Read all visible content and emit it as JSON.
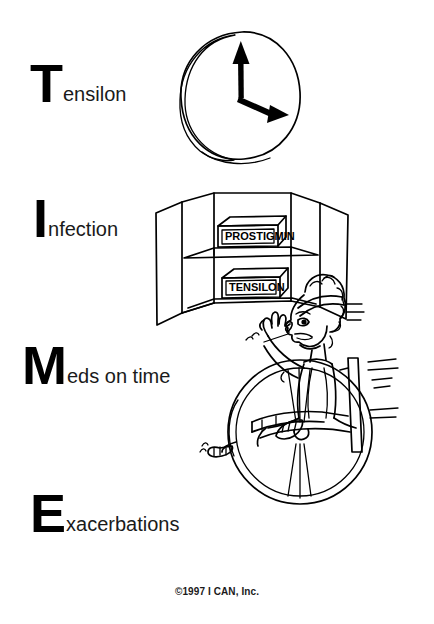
{
  "poster": {
    "title_acronym": "TIME",
    "copyright": "©1997 I CAN, Inc."
  },
  "mnemonic_lines": [
    {
      "id": "tensilon",
      "initial": "T",
      "remainder": "ensilon",
      "full_text": "Tensilon"
    },
    {
      "id": "infection",
      "initial": "I",
      "remainder": "nfection",
      "full_text": "Infection"
    },
    {
      "id": "meds-on-time",
      "initial": "M",
      "remainder": "eds on time",
      "full_text": "Meds on time"
    },
    {
      "id": "exacerbations",
      "initial": "E",
      "remainder": "xacerbations",
      "full_text": "Exacerbations"
    }
  ],
  "illustrations": {
    "clock": {
      "name": "wall-clock",
      "hands": "minute hand pointing up to 12, hour hand pointing right-down toward 2"
    },
    "cabinet": {
      "name": "open-medicine-cabinet",
      "shelf_boxes": [
        {
          "label": "PROSTIGMIN",
          "shelf": "upper"
        },
        {
          "label": "TENSILON",
          "shelf": "lower"
        }
      ]
    },
    "wheelchair": {
      "name": "person-in-wheelchair-waving",
      "description": "cartoon person wearing a headband, seated in a wheelchair, waving one arm, motion lines around head, arm and wheel"
    }
  },
  "colors": {
    "ink": "#000000",
    "background": "#ffffff",
    "text": "#1a1a1a"
  }
}
